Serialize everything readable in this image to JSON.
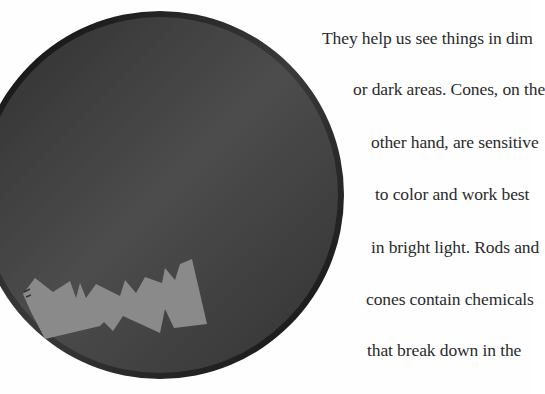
{
  "page": {
    "background": "#fefefe",
    "text_color": "#2a2a2a"
  },
  "illustration": {
    "description": "eye-lens-diagram",
    "ring_color": "#1a1a1a",
    "shape_fill": "#8a8a8a"
  },
  "text": {
    "lines": [
      "They help us see things in dim",
      "or dark areas. Cones, on the",
      "other hand, are sensitive",
      "to color and work best",
      "in bright light. Rods and",
      "cones contain chemicals",
      "that break down in the"
    ]
  }
}
